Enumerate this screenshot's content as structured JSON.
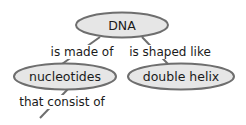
{
  "diagram": {
    "type": "concept-map",
    "colors": {
      "node_fill": "#e6e6e6",
      "node_stroke": "#6e6e6e",
      "text": "#1a1a1a",
      "background": "#ffffff"
    },
    "nodes": [
      {
        "id": "dna",
        "label": "DNA"
      },
      {
        "id": "nucleotides",
        "label": "nucleotides"
      },
      {
        "id": "double_helix",
        "label": "double helix"
      }
    ],
    "links": [
      {
        "from": "dna",
        "to": "nucleotides",
        "label": "is made of"
      },
      {
        "from": "dna",
        "to": "double_helix",
        "label": "is shaped like"
      },
      {
        "from": "nucleotides",
        "to": "",
        "label": "that consist of"
      }
    ]
  }
}
